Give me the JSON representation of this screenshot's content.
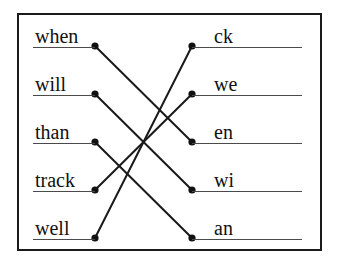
{
  "worksheet": {
    "title": "Word to word-part matching exercise",
    "frame_color": "#1a1a1a",
    "rule_color": "#4a4a4a",
    "line_color": "#1a1a1a",
    "dot_color": "#111111",
    "background": "#ffffff"
  },
  "left_column": {
    "items": [
      {
        "label": "when",
        "x": 95,
        "y": 46
      },
      {
        "label": "will",
        "x": 95,
        "y": 94
      },
      {
        "label": "than",
        "x": 95,
        "y": 142
      },
      {
        "label": "track",
        "x": 95,
        "y": 190
      },
      {
        "label": "well",
        "x": 95,
        "y": 238
      }
    ]
  },
  "right_column": {
    "items": [
      {
        "label": "ck",
        "x": 192,
        "y": 46
      },
      {
        "label": "we",
        "x": 192,
        "y": 94
      },
      {
        "label": "en",
        "x": 192,
        "y": 142
      },
      {
        "label": "wi",
        "x": 192,
        "y": 190
      },
      {
        "label": "an",
        "x": 192,
        "y": 238
      }
    ]
  },
  "connections": [
    {
      "from": "when",
      "to": "en",
      "from_index": 0,
      "to_index": 2
    },
    {
      "from": "will",
      "to": "wi",
      "from_index": 1,
      "to_index": 3
    },
    {
      "from": "than",
      "to": "an",
      "from_index": 2,
      "to_index": 4
    },
    {
      "from": "track",
      "to": "we",
      "from_index": 3,
      "to_index": 1
    },
    {
      "from": "well",
      "to": "ck",
      "from_index": 4,
      "to_index": 0
    }
  ]
}
